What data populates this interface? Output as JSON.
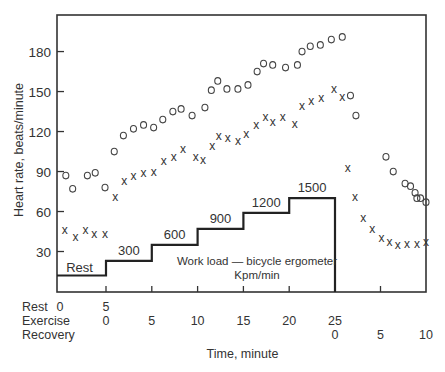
{
  "chart_data": {
    "type": "scatter",
    "title": "",
    "ylabel": "Heart rate, beats/minute",
    "xlabel": "Time, minute",
    "ylim": [
      10,
      200
    ],
    "yticks": [
      30,
      60,
      90,
      120,
      150,
      180
    ],
    "x_rows": [
      {
        "name": "Rest",
        "ticks": [
          {
            "t": 0,
            "label": "0"
          },
          {
            "t": 5,
            "label": "5"
          }
        ]
      },
      {
        "name": "Exercise",
        "ticks": [
          {
            "t": 5,
            "label": "0"
          },
          {
            "t": 10,
            "label": "5"
          },
          {
            "t": 15,
            "label": "10"
          },
          {
            "t": 20,
            "label": "15"
          },
          {
            "t": 25,
            "label": "20"
          },
          {
            "t": 30,
            "label": "25"
          }
        ]
      },
      {
        "name": "Recovery",
        "ticks": [
          {
            "t": 30,
            "label": "0"
          },
          {
            "t": 35,
            "label": "5"
          },
          {
            "t": 40,
            "label": "10"
          }
        ]
      }
    ],
    "grid": false,
    "series": [
      {
        "name": "Heart rate (o)",
        "marker": "o",
        "points": [
          [
            0.9,
            87
          ],
          [
            1.6,
            77
          ],
          [
            3.1,
            87
          ],
          [
            3.9,
            89
          ],
          [
            4.9,
            78
          ],
          [
            5.9,
            105
          ],
          [
            6.9,
            117
          ],
          [
            8.0,
            122
          ],
          [
            9.1,
            125
          ],
          [
            10.2,
            123
          ],
          [
            11.2,
            129
          ],
          [
            12.3,
            135
          ],
          [
            13.2,
            137
          ],
          [
            14.4,
            132
          ],
          [
            15.8,
            138
          ],
          [
            16.5,
            151
          ],
          [
            17.2,
            158
          ],
          [
            18.2,
            152
          ],
          [
            19.4,
            152
          ],
          [
            20.5,
            155
          ],
          [
            21.5,
            165
          ],
          [
            22.2,
            171
          ],
          [
            23.2,
            170
          ],
          [
            24.6,
            168
          ],
          [
            25.9,
            170
          ],
          [
            26.4,
            180
          ],
          [
            27.3,
            184
          ],
          [
            28.4,
            185
          ],
          [
            29.6,
            189
          ],
          [
            30.8,
            191
          ],
          [
            31.7,
            147
          ],
          [
            32.3,
            132
          ],
          [
            35.6,
            101
          ],
          [
            36.4,
            90
          ],
          [
            37.7,
            81
          ],
          [
            38.3,
            79
          ],
          [
            38.8,
            74
          ],
          [
            39.0,
            70
          ],
          [
            39.4,
            70
          ],
          [
            40.0,
            67
          ]
        ]
      },
      {
        "name": "Heart rate (x)",
        "marker": "x",
        "points": [
          [
            0.8,
            46
          ],
          [
            1.9,
            41
          ],
          [
            2.9,
            46
          ],
          [
            3.8,
            43
          ],
          [
            4.9,
            43
          ],
          [
            6.0,
            71
          ],
          [
            7.0,
            83
          ],
          [
            8.0,
            87
          ],
          [
            9.1,
            89
          ],
          [
            10.2,
            90
          ],
          [
            11.3,
            98
          ],
          [
            12.4,
            101
          ],
          [
            13.4,
            107
          ],
          [
            14.8,
            101
          ],
          [
            15.6,
            99
          ],
          [
            16.6,
            109
          ],
          [
            17.3,
            117
          ],
          [
            18.3,
            115
          ],
          [
            19.4,
            113
          ],
          [
            20.3,
            118
          ],
          [
            21.4,
            125
          ],
          [
            22.4,
            131
          ],
          [
            23.2,
            127
          ],
          [
            24.3,
            131
          ],
          [
            25.6,
            126
          ],
          [
            26.4,
            139
          ],
          [
            27.4,
            143
          ],
          [
            28.5,
            145
          ],
          [
            29.9,
            152
          ],
          [
            30.8,
            146
          ],
          [
            31.4,
            93
          ],
          [
            32.2,
            71
          ],
          [
            33.1,
            55
          ],
          [
            34.1,
            47
          ],
          [
            35.1,
            40
          ],
          [
            36.0,
            37
          ],
          [
            36.9,
            35
          ],
          [
            37.9,
            36
          ],
          [
            39.0,
            36
          ],
          [
            40.0,
            37
          ]
        ]
      }
    ],
    "workload": {
      "label_line1": "Work load — bicycle ergometer",
      "label_line2": "Kpm/min",
      "steps": [
        {
          "label": "Rest",
          "t0": 0,
          "t1": 5,
          "level": 12
        },
        {
          "label": "300",
          "t0": 5,
          "t1": 10,
          "level": 23
        },
        {
          "label": "600",
          "t0": 10,
          "t1": 15,
          "level": 35
        },
        {
          "label": "900",
          "t0": 15,
          "t1": 20,
          "level": 47
        },
        {
          "label": "1200",
          "t0": 20,
          "t1": 25,
          "level": 59
        },
        {
          "label": "1500",
          "t0": 25,
          "t1": 30,
          "level": 70
        }
      ]
    }
  }
}
